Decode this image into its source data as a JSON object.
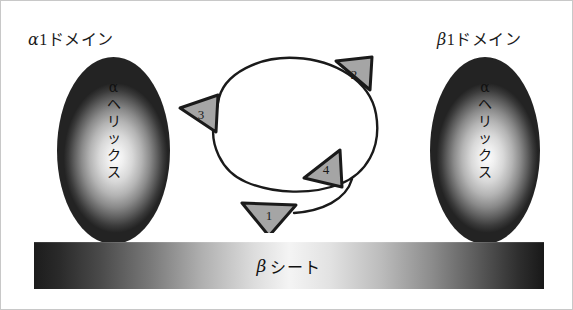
{
  "figure": {
    "background_color": "#ffffff"
  },
  "domains": [
    {
      "id": "alpha1",
      "label_greek": "α",
      "label_rest": "1ドメイン",
      "label_full": "α1ドメイン",
      "structure_lines": [
        "α",
        "ヘ",
        "リ",
        "ッ",
        "ク",
        "ス"
      ],
      "structure_full": "αヘリックス"
    },
    {
      "id": "beta1",
      "label_greek": "β",
      "label_rest": "1ドメイン",
      "label_full": "β1ドメイン",
      "structure_lines": [
        "α",
        "ヘ",
        "リ",
        "ッ",
        "ク",
        "ス"
      ],
      "structure_full": "αヘリックス"
    }
  ],
  "beta_sheet": {
    "label_greek": "β",
    "label_rest": "シート",
    "label_full": "βシート"
  },
  "peptide_loop": {
    "anchors": [
      {
        "number": "1",
        "position": "bottom",
        "points_to": "down",
        "fill": "#a5a5a5"
      },
      {
        "number": "2",
        "position": "top-right",
        "points_to": "left",
        "fill": "#a5a5a5"
      },
      {
        "number": "3",
        "position": "left",
        "points_to": "left",
        "fill": "#a5a5a5"
      },
      {
        "number": "4",
        "position": "bottom-center",
        "points_to": "left",
        "fill": "#a5a5a5"
      }
    ],
    "loop_stroke": "#1a1a1a",
    "loop_fill": "#ffffff"
  },
  "colors": {
    "outline": "#1a1a1a",
    "anchor_fill": "#a5a5a5",
    "text": "#111111",
    "frame": "#c8c8c8"
  }
}
